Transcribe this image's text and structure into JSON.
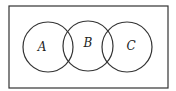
{
  "diagram": {
    "type": "venn",
    "universe": {
      "x": 9,
      "y": 6,
      "width": 159,
      "height": 82,
      "stroke": "#333333"
    },
    "sets": [
      {
        "label": "A",
        "cx": 48,
        "cy": 47,
        "r": 25,
        "label_x": 42,
        "label_y": 51
      },
      {
        "label": "B",
        "cx": 88,
        "cy": 46,
        "r": 25,
        "label_x": 88,
        "label_y": 47
      },
      {
        "label": "C",
        "cx": 127,
        "cy": 47,
        "r": 25,
        "label_x": 131,
        "label_y": 50
      }
    ],
    "line_color": "#333333"
  }
}
